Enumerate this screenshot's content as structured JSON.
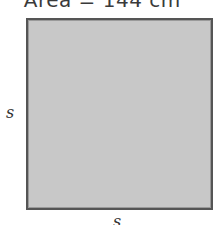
{
  "title": "Area = 144 cm²",
  "shape": {
    "type": "square",
    "fill": "#c8c8c8",
    "stroke": "#555555"
  },
  "labels": {
    "left_side": "s",
    "bottom_side": "s"
  }
}
